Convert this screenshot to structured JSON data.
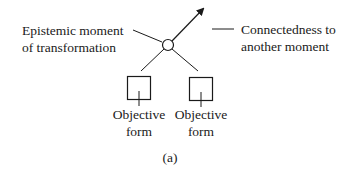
{
  "diagram": {
    "left_label": {
      "line1": "Epistemic moment",
      "line2": "of transformation"
    },
    "right_label": {
      "line1": "Connectedness to",
      "line2": "another moment"
    },
    "forms": [
      {
        "line1": "Objective",
        "line2": "form"
      },
      {
        "line1": "Objective",
        "line2": "form"
      }
    ],
    "caption": "(a)",
    "colors": {
      "stroke": "#1a1a1a",
      "background": "#ffffff"
    }
  }
}
